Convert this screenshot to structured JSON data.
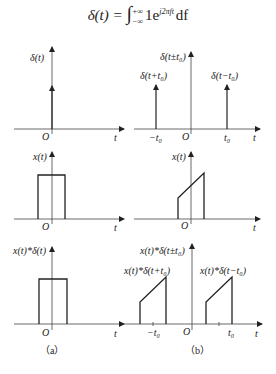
{
  "formula": {
    "lhs": "δ(t) = ",
    "integral": "∫",
    "upper": "+∞",
    "lower": "−∞",
    "integrand": "1e",
    "exponent": "j2πft",
    "differential": "df"
  },
  "panels": {
    "a": {
      "caption": "（a）",
      "row1": {
        "ylabel": "δ(t)",
        "origin": "O",
        "xlabel": "t"
      },
      "row2": {
        "ylabel": "x(t)",
        "origin": "O",
        "xlabel": "t"
      },
      "row3": {
        "ylabel": "x(t)*δ(t)",
        "origin": "O",
        "xlabel": "t"
      }
    },
    "b": {
      "caption": "（b）",
      "row1": {
        "ylabel": "δ(t±t₀)",
        "left_label": "δ(t+t₀)",
        "right_label": "δ(t−t₀)",
        "neg_tick": "−t₀",
        "pos_tick": "t₀",
        "origin": "O",
        "xlabel": "t"
      },
      "row2": {
        "ylabel": "x(t)",
        "origin": "O",
        "xlabel": "t"
      },
      "row3": {
        "ylabel": "x(t)*δ(t±t₀)",
        "left_label": "x(t)*δ(t+t₀)",
        "right_label": "x(t)*δ(t−t₀)",
        "neg_tick": "−t₀",
        "pos_tick": "t₀",
        "origin": "O",
        "xlabel": "t"
      }
    }
  }
}
